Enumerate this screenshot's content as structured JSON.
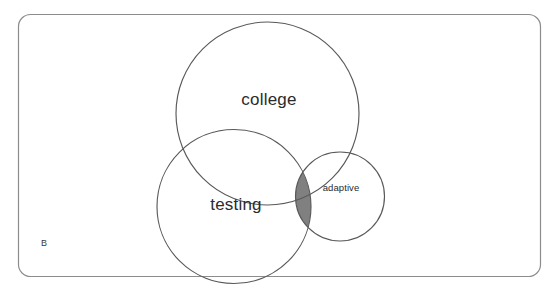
{
  "figure": {
    "panel_label": "B",
    "background_color": "#ffffff",
    "border_color": "#8c8c8c",
    "stroke_color": "#595959",
    "text_color": "#2b2b2b",
    "shade_color": "#808080"
  },
  "chart_data": {
    "type": "venn",
    "title": "",
    "panel": "B",
    "sets": [
      {
        "name": "college",
        "label": "college",
        "cx": 267.5,
        "cy": 113.5,
        "r": 91.5,
        "label_x": 269,
        "label_y": 100,
        "fill": "none",
        "stroke": "#595959"
      },
      {
        "name": "testing",
        "label": "testing",
        "cx": 234,
        "cy": 206.5,
        "r": 77,
        "label_x": 236,
        "label_y": 205,
        "fill": "none",
        "stroke": "#595959"
      },
      {
        "name": "adaptive",
        "label": "adaptive",
        "cx": 340,
        "cy": 196.5,
        "r": 44.5,
        "label_x": 341,
        "label_y": 187,
        "fill": "none",
        "stroke": "#595959"
      }
    ],
    "highlighted_regions": [
      {
        "name": "testing-adaptive-intersection",
        "sets": [
          "testing",
          "adaptive"
        ],
        "fill": "#808080",
        "description": "lens-shaped overlap of testing and adaptive, shaded grey"
      }
    ],
    "legend": [],
    "annotations": [
      {
        "name": "panel-letter",
        "text": "B",
        "x": 44,
        "y": 243
      }
    ]
  },
  "labels": {
    "college": "college",
    "testing": "testing",
    "adaptive": "adaptive",
    "panel": "B"
  }
}
